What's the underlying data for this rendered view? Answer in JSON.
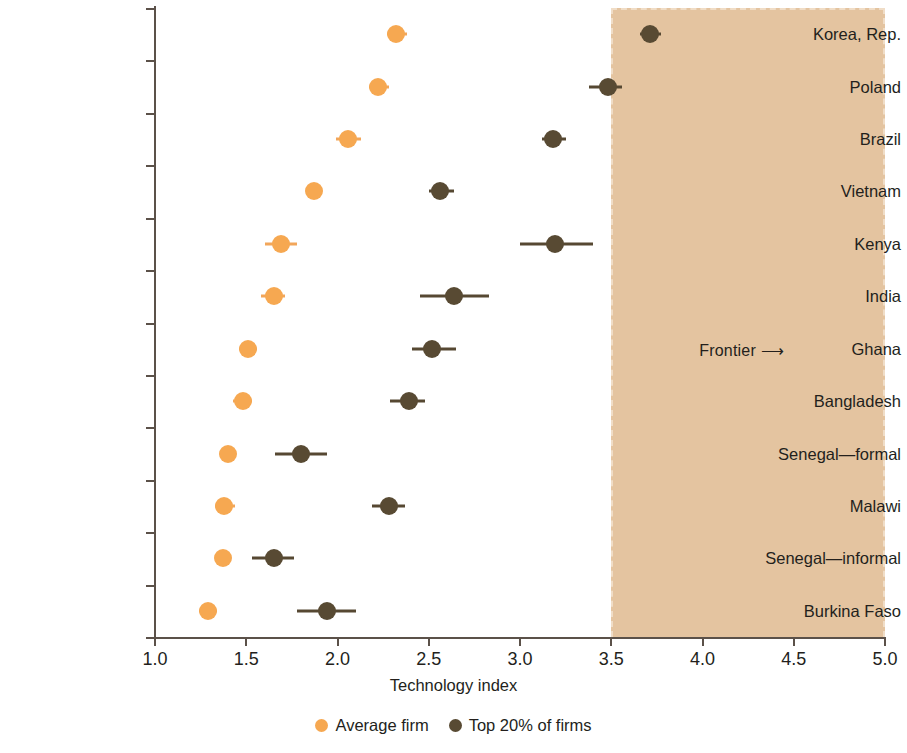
{
  "chart_data": {
    "type": "scatter",
    "title": "",
    "xlabel": "Technology index",
    "ylabel": "",
    "xlim": [
      1.0,
      5.0
    ],
    "xticks": [
      "1.0",
      "1.5",
      "2.0",
      "2.5",
      "3.0",
      "3.5",
      "4.0",
      "4.5",
      "5.0"
    ],
    "xtick_values": [
      1.0,
      1.5,
      2.0,
      2.5,
      3.0,
      3.5,
      4.0,
      4.5,
      5.0
    ],
    "grid": false,
    "legend_position": "bottom",
    "categories": [
      "Korea, Rep.",
      "Poland",
      "Brazil",
      "Vietnam",
      "Kenya",
      "India",
      "Ghana",
      "Bangladesh",
      "Senegal—formal",
      "Malawi",
      "Senegal—informal",
      "Burkina Faso"
    ],
    "series": [
      {
        "name": "Average firm",
        "color": "#f6a851",
        "values": [
          2.32,
          2.22,
          2.06,
          1.87,
          1.69,
          1.65,
          1.51,
          1.48,
          1.4,
          1.38,
          1.37,
          1.29
        ],
        "ci_low": [
          2.27,
          2.17,
          1.99,
          1.83,
          1.6,
          1.58,
          1.46,
          1.43,
          1.38,
          1.33,
          1.35,
          1.24
        ],
        "ci_high": [
          2.38,
          2.28,
          2.13,
          1.91,
          1.78,
          1.71,
          1.56,
          1.53,
          1.42,
          1.44,
          1.39,
          1.34
        ]
      },
      {
        "name": "Top 20% of firms",
        "color": "#584a33",
        "values": [
          3.71,
          3.48,
          3.18,
          2.56,
          3.19,
          2.64,
          2.52,
          2.39,
          1.8,
          2.28,
          1.65,
          1.94
        ],
        "ci_low": [
          3.66,
          3.38,
          3.12,
          2.5,
          3.0,
          2.45,
          2.41,
          2.29,
          1.66,
          2.19,
          1.53,
          1.78
        ],
        "ci_high": [
          3.77,
          3.56,
          3.25,
          2.64,
          3.4,
          2.83,
          2.65,
          2.48,
          1.94,
          2.37,
          1.76,
          2.1
        ]
      }
    ],
    "annotations": [
      {
        "name": "frontier",
        "label": "Frontier ⟶",
        "band_start": 3.5,
        "band_end": 5.0,
        "band_color": "#e4c4a0"
      }
    ]
  },
  "legend": {
    "items": [
      {
        "label": "Average firm",
        "color": "#f6a851"
      },
      {
        "label": "Top 20% of firms",
        "color": "#584a33"
      }
    ]
  },
  "axis": {
    "x_title": "Technology index"
  }
}
